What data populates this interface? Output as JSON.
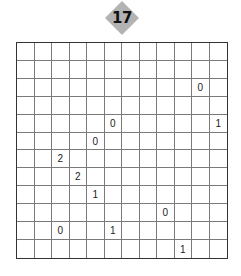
{
  "puzzle": {
    "number": "17",
    "rows": 12,
    "cols": 12,
    "badge_color": "#b3b3b3",
    "clues": [
      {
        "row": 2,
        "col": 10,
        "value": "0"
      },
      {
        "row": 4,
        "col": 5,
        "value": "0"
      },
      {
        "row": 4,
        "col": 11,
        "value": "1"
      },
      {
        "row": 5,
        "col": 4,
        "value": "0"
      },
      {
        "row": 6,
        "col": 2,
        "value": "2"
      },
      {
        "row": 7,
        "col": 3,
        "value": "2"
      },
      {
        "row": 8,
        "col": 4,
        "value": "1"
      },
      {
        "row": 9,
        "col": 8,
        "value": "0"
      },
      {
        "row": 10,
        "col": 2,
        "value": "0"
      },
      {
        "row": 10,
        "col": 5,
        "value": "1"
      },
      {
        "row": 11,
        "col": 9,
        "value": "1"
      }
    ]
  }
}
